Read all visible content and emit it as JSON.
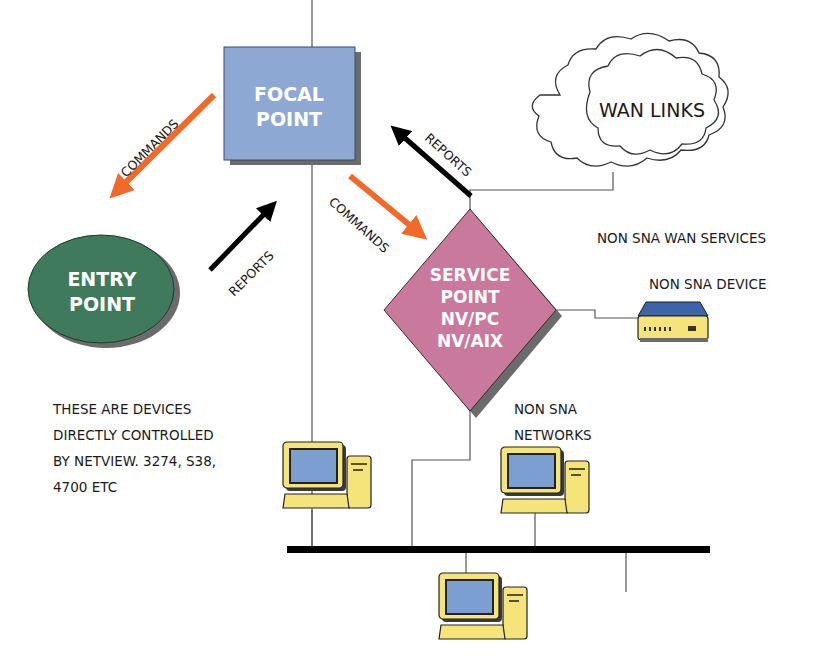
{
  "diagram": {
    "nodes": {
      "focal_point": {
        "line1": "FOCAL",
        "line2": "POINT",
        "color": "#8ea8d4"
      },
      "entry_point": {
        "line1": "ENTRY",
        "line2": "POINT",
        "color": "#3f7a5c"
      },
      "service_point": {
        "line1": "SERVICE",
        "line2": "POINT",
        "line3": "NV/PC",
        "line4": "NV/AIX",
        "color": "#c97a9c"
      },
      "wan_links": {
        "label": "WAN LINKS"
      }
    },
    "arrows": {
      "commands_to_entry": {
        "label": "COMMANDS",
        "color": "#f26a2a"
      },
      "reports_from_entry": {
        "label": "REPORTS",
        "color": "#000000"
      },
      "commands_to_service": {
        "label": "COMMANDS",
        "color": "#f26a2a"
      },
      "reports_from_service": {
        "label": "REPORTS",
        "color": "#000000"
      }
    },
    "labels": {
      "non_sna_wan_services": "NON SNA WAN SERVICES",
      "non_sna_device": "NON SNA DEVICE",
      "non_sna_networks_line1": "NON SNA",
      "non_sna_networks_line2": "NETWORKS",
      "note_line1": "THESE ARE DEVICES",
      "note_line2": "DIRECTLY CONTROLLED",
      "note_line3": "BY NETVIEW. 3274, S38,",
      "note_line4": "4700 ETC"
    },
    "colors": {
      "computer_body": "#f5e47a",
      "computer_screen": "#7a9fd0",
      "device_top": "#3d63a8",
      "shadow": "#6b6b6b"
    }
  }
}
